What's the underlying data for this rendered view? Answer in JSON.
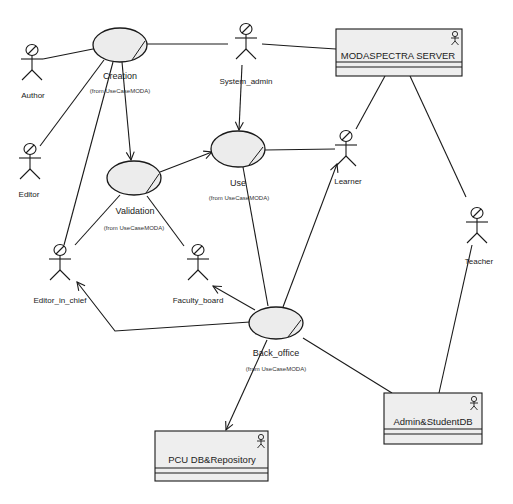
{
  "diagram": {
    "type": "UML use case diagram",
    "use_cases": [
      {
        "id": "creation",
        "label": "Creation",
        "from": "(from UseCaseMODA)"
      },
      {
        "id": "validation",
        "label": "Validation",
        "from": "(from UseCaseMODA)"
      },
      {
        "id": "use",
        "label": "Use",
        "from": "(from UseCaseMODA)"
      },
      {
        "id": "back_office",
        "label": "Back_office",
        "from": "(from UseCaseMODA)"
      }
    ],
    "actors": [
      {
        "id": "author",
        "label": "Author"
      },
      {
        "id": "editor",
        "label": "Editor"
      },
      {
        "id": "system_admin",
        "label": "System_admin"
      },
      {
        "id": "learner",
        "label": "Learner"
      },
      {
        "id": "editor_in_chief",
        "label": "Editor_in_chief"
      },
      {
        "id": "faculty_board",
        "label": "Faculty_board"
      },
      {
        "id": "teacher",
        "label": "Teacher"
      }
    ],
    "systems": [
      {
        "id": "modaspectra_server",
        "label": "MODASPECTRA SERVER"
      },
      {
        "id": "admin_student_db",
        "label": "Admin&StudentDB"
      },
      {
        "id": "pcu_db_repository",
        "label": "PCU DB&Repository"
      }
    ],
    "relations": [
      {
        "from": "Author",
        "to": "Creation",
        "arrow": false
      },
      {
        "from": "Editor",
        "to": "Creation",
        "arrow": false
      },
      {
        "from": "Editor_in_chief",
        "to": "Creation",
        "arrow": false
      },
      {
        "from": "Creation",
        "to": "MODASPECTRA SERVER",
        "arrow": false
      },
      {
        "from": "System_admin",
        "to": "MODASPECTRA SERVER",
        "arrow": false
      },
      {
        "from": "Creation",
        "to": "Validation",
        "arrow": true
      },
      {
        "from": "Validation",
        "to": "Use",
        "arrow": true
      },
      {
        "from": "System_admin",
        "to": "Use",
        "arrow": true
      },
      {
        "from": "Use",
        "to": "Learner",
        "arrow": false
      },
      {
        "from": "Use",
        "to": "Back_office",
        "arrow": false
      },
      {
        "from": "Validation",
        "to": "Editor_in_chief",
        "arrow": false
      },
      {
        "from": "Validation",
        "to": "Faculty_board",
        "arrow": false
      },
      {
        "from": "MODASPECTRA SERVER",
        "to": "Learner",
        "arrow": false
      },
      {
        "from": "MODASPECTRA SERVER",
        "to": "Teacher",
        "arrow": false
      },
      {
        "from": "Back_office",
        "to": "Learner",
        "arrow": true
      },
      {
        "from": "Back_office",
        "to": "Editor_in_chief",
        "arrow": true
      },
      {
        "from": "Back_office",
        "to": "Faculty_board",
        "arrow": true
      },
      {
        "from": "Back_office",
        "to": "PCU DB&Repository",
        "arrow": true
      },
      {
        "from": "Back_office",
        "to": "Admin&StudentDB",
        "arrow": false
      },
      {
        "from": "Teacher",
        "to": "Admin&StudentDB",
        "arrow": false
      }
    ]
  },
  "labels": {
    "creation": "Creation",
    "creation_from": "(from UseCaseMODA)",
    "validation": "Validation",
    "validation_from": "(from UseCaseMODA)",
    "use": "Use",
    "use_from": "(from UseCaseMODA)",
    "back_office": "Back_office",
    "back_office_from": "(from UseCaseMODA)",
    "author": "Author",
    "editor": "Editor",
    "system_admin": "System_admin",
    "learner": "Learner",
    "editor_in_chief": "Editor_in_chief",
    "faculty_board": "Faculty_board",
    "teacher": "Teacher",
    "modaspectra_server": "MODASPECTRA SERVER",
    "admin_student_db": "Admin&StudentDB",
    "pcu_db_repository": "PCU DB&Repository"
  },
  "colors": {
    "background": "#ffffff",
    "stroke": "#1a1a1a",
    "usecase_fill": "#ececec",
    "box_fill": "#eeeeee"
  }
}
